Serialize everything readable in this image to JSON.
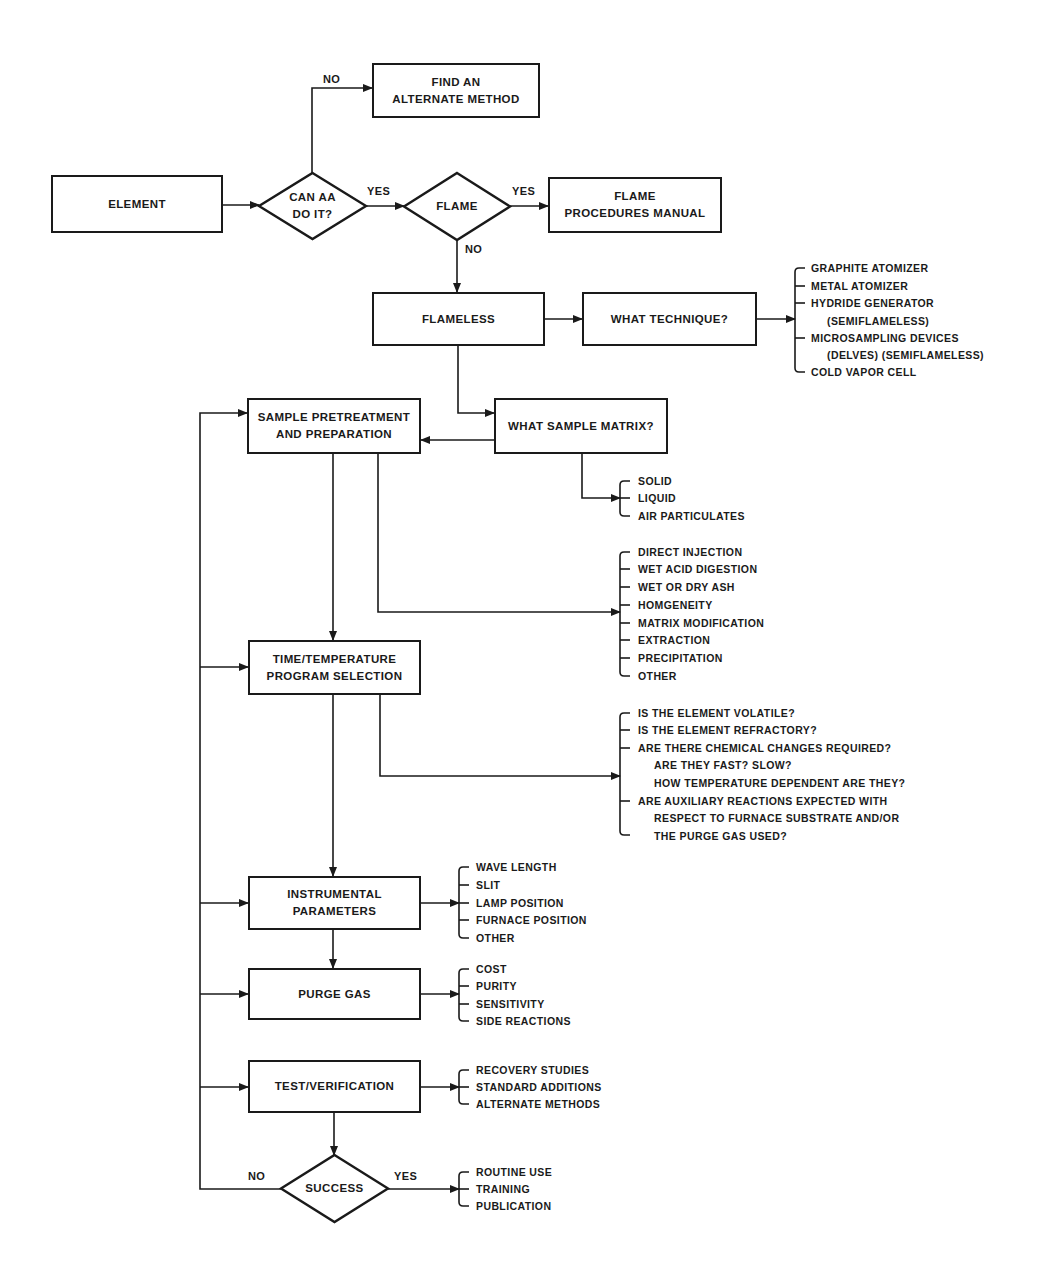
{
  "diagram": {
    "type": "flowchart",
    "stroke_color": "#1a1a1a",
    "background": "#ffffff",
    "nodes": [
      {
        "id": "element",
        "shape": "rect",
        "label": "ELEMENT",
        "x": 51,
        "y": 175,
        "w": 172,
        "h": 58
      },
      {
        "id": "can-aa",
        "shape": "diamond",
        "label": "CAN AA\nDO IT?",
        "x": 259,
        "y": 173,
        "w": 107,
        "h": 66
      },
      {
        "id": "find-alternate",
        "shape": "rect",
        "label": "FIND AN\nALTERNATE METHOD",
        "x": 372,
        "y": 63,
        "w": 168,
        "h": 55
      },
      {
        "id": "flame",
        "shape": "diamond",
        "label": "FLAME",
        "x": 404,
        "y": 173,
        "w": 106,
        "h": 67
      },
      {
        "id": "flame-manual",
        "shape": "rect",
        "label": "FLAME\nPROCEDURES MANUAL",
        "x": 548,
        "y": 177,
        "w": 174,
        "h": 56
      },
      {
        "id": "flameless",
        "shape": "rect",
        "label": "FLAMELESS",
        "x": 372,
        "y": 292,
        "w": 173,
        "h": 54
      },
      {
        "id": "what-technique",
        "shape": "rect",
        "label": "WHAT TECHNIQUE?",
        "x": 582,
        "y": 292,
        "w": 175,
        "h": 54
      },
      {
        "id": "sample-prep",
        "shape": "rect",
        "label": "SAMPLE PRETREATMENT\nAND PREPARATION",
        "x": 247,
        "y": 398,
        "w": 174,
        "h": 56
      },
      {
        "id": "what-matrix",
        "shape": "rect",
        "label": "WHAT SAMPLE MATRIX?",
        "x": 494,
        "y": 398,
        "w": 174,
        "h": 56
      },
      {
        "id": "time-temp",
        "shape": "rect",
        "label": "TIME/TEMPERATURE\nPROGRAM SELECTION",
        "x": 248,
        "y": 640,
        "w": 173,
        "h": 55
      },
      {
        "id": "instrumental",
        "shape": "rect",
        "label": "INSTRUMENTAL\nPARAMETERS",
        "x": 248,
        "y": 876,
        "w": 173,
        "h": 54
      },
      {
        "id": "purge-gas",
        "shape": "rect",
        "label": "PURGE GAS",
        "x": 248,
        "y": 968,
        "w": 173,
        "h": 52
      },
      {
        "id": "test-verification",
        "shape": "rect",
        "label": "TEST/VERIFICATION",
        "x": 248,
        "y": 1060,
        "w": 173,
        "h": 53
      },
      {
        "id": "success",
        "shape": "diamond",
        "label": "SUCCESS",
        "x": 281,
        "y": 1155,
        "w": 107,
        "h": 67
      }
    ],
    "edge_labels": [
      {
        "id": "can-aa-no",
        "text": "NO",
        "x": 323,
        "y": 73
      },
      {
        "id": "can-aa-yes",
        "text": "YES",
        "x": 367,
        "y": 185
      },
      {
        "id": "flame-yes",
        "text": "YES",
        "x": 512,
        "y": 185
      },
      {
        "id": "flame-no",
        "text": "NO",
        "x": 465,
        "y": 243
      },
      {
        "id": "success-no",
        "text": "NO",
        "x": 248,
        "y": 1170
      },
      {
        "id": "success-yes",
        "text": "YES",
        "x": 394,
        "y": 1170
      }
    ],
    "edges": [
      {
        "id": "element-to-canaa",
        "points": [
          [
            223,
            205
          ],
          [
            259,
            205
          ]
        ],
        "arrow": true
      },
      {
        "id": "canaa-no",
        "points": [
          [
            312,
            173
          ],
          [
            312,
            88
          ],
          [
            372,
            88
          ]
        ],
        "arrow": true
      },
      {
        "id": "canaa-yes",
        "points": [
          [
            366,
            206
          ],
          [
            404,
            206
          ]
        ],
        "arrow": true
      },
      {
        "id": "flame-yes",
        "points": [
          [
            510,
            206
          ],
          [
            548,
            206
          ]
        ],
        "arrow": true
      },
      {
        "id": "flame-no",
        "points": [
          [
            457,
            240
          ],
          [
            457,
            292
          ]
        ],
        "arrow": true
      },
      {
        "id": "flameless-to-technique",
        "points": [
          [
            545,
            319
          ],
          [
            582,
            319
          ]
        ],
        "arrow": true
      },
      {
        "id": "technique-to-list",
        "points": [
          [
            757,
            319
          ],
          [
            795,
            319
          ]
        ],
        "arrow": true
      },
      {
        "id": "flameless-to-matrix",
        "points": [
          [
            458,
            346
          ],
          [
            458,
            413
          ],
          [
            494,
            413
          ]
        ],
        "arrow": true
      },
      {
        "id": "matrix-to-prep",
        "points": [
          [
            494,
            440
          ],
          [
            421,
            440
          ]
        ],
        "arrow": true
      },
      {
        "id": "matrix-to-list",
        "points": [
          [
            582,
            454
          ],
          [
            582,
            498
          ],
          [
            620,
            498
          ]
        ],
        "arrow": true
      },
      {
        "id": "prep-to-list",
        "points": [
          [
            378,
            454
          ],
          [
            378,
            612
          ],
          [
            620,
            612
          ]
        ],
        "arrow": true
      },
      {
        "id": "prep-to-time",
        "points": [
          [
            333,
            454
          ],
          [
            333,
            640
          ]
        ],
        "arrow": true
      },
      {
        "id": "time-to-list",
        "points": [
          [
            380,
            695
          ],
          [
            380,
            776
          ],
          [
            620,
            776
          ]
        ],
        "arrow": true
      },
      {
        "id": "time-to-instrumental",
        "points": [
          [
            333,
            695
          ],
          [
            333,
            876
          ]
        ],
        "arrow": true
      },
      {
        "id": "instrumental-to-list",
        "points": [
          [
            421,
            903
          ],
          [
            459,
            903
          ]
        ],
        "arrow": true
      },
      {
        "id": "instrumental-to-purge",
        "points": [
          [
            333,
            930
          ],
          [
            333,
            968
          ]
        ],
        "arrow": true
      },
      {
        "id": "purge-to-list",
        "points": [
          [
            421,
            994
          ],
          [
            459,
            994
          ]
        ],
        "arrow": true
      },
      {
        "id": "test-to-list",
        "points": [
          [
            421,
            1087
          ],
          [
            459,
            1087
          ]
        ],
        "arrow": true
      },
      {
        "id": "test-to-success",
        "points": [
          [
            334,
            1113
          ],
          [
            334,
            1155
          ]
        ],
        "arrow": true
      },
      {
        "id": "success-yes",
        "points": [
          [
            388,
            1189
          ],
          [
            459,
            1189
          ]
        ],
        "arrow": true
      },
      {
        "id": "success-no-loop",
        "points": [
          [
            281,
            1189
          ],
          [
            200,
            1189
          ],
          [
            200,
            413
          ],
          [
            247,
            413
          ]
        ],
        "arrow": true
      },
      {
        "id": "loop-to-time",
        "points": [
          [
            200,
            667
          ],
          [
            248,
            667
          ]
        ],
        "arrow": true
      },
      {
        "id": "loop-to-instrumental",
        "points": [
          [
            200,
            903
          ],
          [
            248,
            903
          ]
        ],
        "arrow": true
      },
      {
        "id": "loop-to-purge",
        "points": [
          [
            200,
            994
          ],
          [
            248,
            994
          ]
        ],
        "arrow": true
      },
      {
        "id": "loop-to-test",
        "points": [
          [
            200,
            1087
          ],
          [
            248,
            1087
          ]
        ],
        "arrow": true
      }
    ],
    "lists": [
      {
        "id": "technique-options",
        "bracket_x": 795,
        "text_x": 811,
        "y_top": 268,
        "y_bottom": 372,
        "items": [
          {
            "text": "GRAPHITE ATOMIZER",
            "y": 268,
            "tick": true
          },
          {
            "text": "METAL ATOMIZER",
            "y": 286,
            "tick": true
          },
          {
            "text": "HYDRIDE GENERATOR",
            "y": 303,
            "tick": true
          },
          {
            "text": "(SEMIFLAMELESS)",
            "y": 321,
            "tick": false,
            "indent": 16
          },
          {
            "text": "MICROSAMPLING DEVICES",
            "y": 338,
            "tick": true
          },
          {
            "text": "(DELVES) (SEMIFLAMELESS)",
            "y": 355,
            "tick": false,
            "indent": 16
          },
          {
            "text": "COLD VAPOR CELL",
            "y": 372,
            "tick": true
          }
        ]
      },
      {
        "id": "matrix-options",
        "bracket_x": 620,
        "text_x": 638,
        "y_top": 481,
        "y_bottom": 516,
        "items": [
          {
            "text": "SOLID",
            "y": 481,
            "tick": true
          },
          {
            "text": "LIQUID",
            "y": 498,
            "tick": true
          },
          {
            "text": "AIR PARTICULATES",
            "y": 516,
            "tick": true
          }
        ]
      },
      {
        "id": "prep-options",
        "bracket_x": 620,
        "text_x": 638,
        "y_top": 552,
        "y_bottom": 676,
        "items": [
          {
            "text": "DIRECT INJECTION",
            "y": 552,
            "tick": true
          },
          {
            "text": "WET ACID DIGESTION",
            "y": 569,
            "tick": true
          },
          {
            "text": "WET OR DRY ASH",
            "y": 587,
            "tick": true
          },
          {
            "text": "HOMGENEITY",
            "y": 605,
            "tick": true
          },
          {
            "text": "MATRIX MODIFICATION",
            "y": 623,
            "tick": true
          },
          {
            "text": "EXTRACTION",
            "y": 640,
            "tick": true
          },
          {
            "text": "PRECIPITATION",
            "y": 658,
            "tick": true
          },
          {
            "text": "OTHER",
            "y": 676,
            "tick": true
          }
        ]
      },
      {
        "id": "time-temp-questions",
        "bracket_x": 620,
        "text_x": 638,
        "y_top": 713,
        "y_bottom": 835,
        "items": [
          {
            "text": "IS THE ELEMENT VOLATILE?",
            "y": 713,
            "tick": true
          },
          {
            "text": "IS THE ELEMENT REFRACTORY?",
            "y": 730,
            "tick": true
          },
          {
            "text": "ARE THERE CHEMICAL CHANGES REQUIRED?",
            "y": 748,
            "tick": true
          },
          {
            "text": "ARE THEY FAST?  SLOW?",
            "y": 765,
            "tick": false,
            "indent": 16
          },
          {
            "text": "HOW TEMPERATURE DEPENDENT ARE THEY?",
            "y": 783,
            "tick": false,
            "indent": 16
          },
          {
            "text": "ARE AUXILIARY REACTIONS EXPECTED WITH",
            "y": 801,
            "tick": true
          },
          {
            "text": "RESPECT TO FURNACE SUBSTRATE AND/OR",
            "y": 818,
            "tick": false,
            "indent": 16
          },
          {
            "text": "THE PURGE GAS USED?",
            "y": 836,
            "tick": false,
            "indent": 16
          }
        ]
      },
      {
        "id": "instrumental-options",
        "bracket_x": 459,
        "text_x": 476,
        "y_top": 867,
        "y_bottom": 938,
        "items": [
          {
            "text": "WAVE LENGTH",
            "y": 867,
            "tick": true
          },
          {
            "text": "SLIT",
            "y": 885,
            "tick": true
          },
          {
            "text": "LAMP POSITION",
            "y": 903,
            "tick": true
          },
          {
            "text": "FURNACE POSITION",
            "y": 920,
            "tick": true
          },
          {
            "text": "OTHER",
            "y": 938,
            "tick": true
          }
        ]
      },
      {
        "id": "purge-options",
        "bracket_x": 459,
        "text_x": 476,
        "y_top": 969,
        "y_bottom": 1021,
        "items": [
          {
            "text": "COST",
            "y": 969,
            "tick": true
          },
          {
            "text": "PURITY",
            "y": 986,
            "tick": true
          },
          {
            "text": "SENSITIVITY",
            "y": 1004,
            "tick": true
          },
          {
            "text": "SIDE REACTIONS",
            "y": 1021,
            "tick": true
          }
        ]
      },
      {
        "id": "test-options",
        "bracket_x": 459,
        "text_x": 476,
        "y_top": 1070,
        "y_bottom": 1104,
        "items": [
          {
            "text": "RECOVERY STUDIES",
            "y": 1070,
            "tick": true
          },
          {
            "text": "STANDARD ADDITIONS",
            "y": 1087,
            "tick": true
          },
          {
            "text": "ALTERNATE METHODS",
            "y": 1104,
            "tick": true
          }
        ]
      },
      {
        "id": "success-options",
        "bracket_x": 459,
        "text_x": 476,
        "y_top": 1172,
        "y_bottom": 1206,
        "items": [
          {
            "text": "ROUTINE USE",
            "y": 1172,
            "tick": true
          },
          {
            "text": "TRAINING",
            "y": 1189,
            "tick": true
          },
          {
            "text": "PUBLICATION",
            "y": 1206,
            "tick": true
          }
        ]
      }
    ]
  }
}
